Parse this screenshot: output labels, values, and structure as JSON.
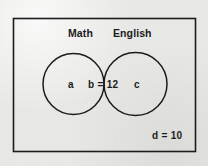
{
  "diagram": {
    "type": "venn-diagram",
    "title": "",
    "universe": {
      "name": "universal-set-rectangle",
      "outside_label": "d = 10",
      "outside_value": 10,
      "outside_symbol": "d"
    },
    "sets": [
      {
        "id": "math",
        "title": "Math",
        "region_label": "a",
        "region_symbol": "a",
        "region_value": null
      },
      {
        "id": "english",
        "title": "English",
        "region_label": "c",
        "region_symbol": "c",
        "region_value": null
      }
    ],
    "intersection": {
      "id": "math-and-english",
      "label": "b = 12",
      "symbol": "b",
      "value": 12
    },
    "colors": {
      "stroke": "#1c1c1c",
      "text": "#1c1c1c",
      "background": "#e9e9e7",
      "fill": "none"
    }
  }
}
